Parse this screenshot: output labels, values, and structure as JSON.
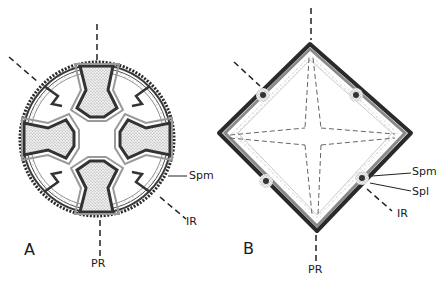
{
  "figure": {
    "panels": [
      {
        "id": "A",
        "label": "A",
        "shape": "circular cross-section with four lobed chambers",
        "annotations": {
          "spm": "Spm",
          "ir": "IR",
          "pr": "PR"
        }
      },
      {
        "id": "B",
        "label": "B",
        "shape": "diamond (square rotated 45°) cross-section with four corner nodes",
        "annotations": {
          "spm": "Spm",
          "spl": "Spl",
          "ir": "IR",
          "pr": "PR"
        }
      }
    ],
    "colors": {
      "ink": "#1a1a1a",
      "wall_dark": "#3a3a3a",
      "wall_mid": "#8a8a8a",
      "stipple": "#d8d8d8",
      "background": "#ffffff"
    }
  }
}
